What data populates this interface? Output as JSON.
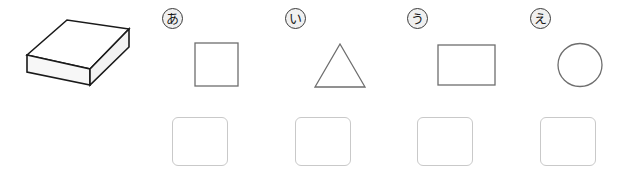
{
  "worksheet": {
    "background_color": "#ffffff",
    "stroke_color": "#6e6e6e",
    "solid_outline_color": "#1a1a1a",
    "answer_box_border_color": "#c9c9c9",
    "label_fill_color": "#f0f0f0"
  },
  "solid": {
    "name": "rectangular-cuboid",
    "top_face_fill": "#ffffff",
    "left_face_fill": "#f7f7f7",
    "front_face_fill": "#f2f2f2",
    "alt_text": ""
  },
  "options": [
    {
      "label": "あ",
      "shape": "square",
      "answer": ""
    },
    {
      "label": "い",
      "shape": "triangle",
      "answer": ""
    },
    {
      "label": "う",
      "shape": "rectangle",
      "answer": ""
    },
    {
      "label": "え",
      "shape": "circle",
      "answer": ""
    }
  ]
}
